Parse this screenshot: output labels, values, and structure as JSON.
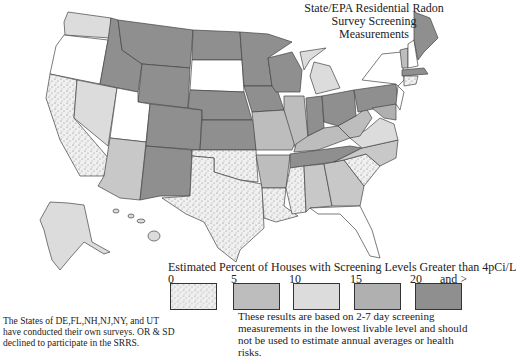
{
  "title": {
    "line1": "State/EPA Residential Radon",
    "line2": "Survey Screening Measurements"
  },
  "legend": {
    "title": "Estimated Percent of Houses with Screening Levels Greater than 4pCi/L",
    "ticks": [
      "0",
      "5",
      "10",
      "15",
      "20",
      "and >"
    ],
    "classes": [
      {
        "range": "0-5",
        "fill": "#e8e8e8",
        "pattern": "stipple"
      },
      {
        "range": "5-10",
        "fill": "#bdbdbd",
        "pattern": "solid"
      },
      {
        "range": "10-15",
        "fill": "#dcdcdc",
        "pattern": "solid"
      },
      {
        "range": "15-20",
        "fill": "#b0b0b0",
        "pattern": "solid"
      },
      {
        "range": "20+",
        "fill": "#8f8f8f",
        "pattern": "solid"
      }
    ]
  },
  "note": "These results are based on 2-7 day screening measurements in the lowest livable level and should not be used to estimate annual averages or health risks.",
  "footnote": "The States of DE,FL,NH,NJ,NY, and UT have conducted their own surveys. OR & SD declined to participate in the SRRS.",
  "colors": {
    "none": "#ffffff",
    "c0": "#e8e8e8",
    "c5": "#bdbdbd",
    "c10": "#dcdcdc",
    "c15": "#b0b0b0",
    "c20": "#8f8f8f",
    "border": "#444444"
  }
}
